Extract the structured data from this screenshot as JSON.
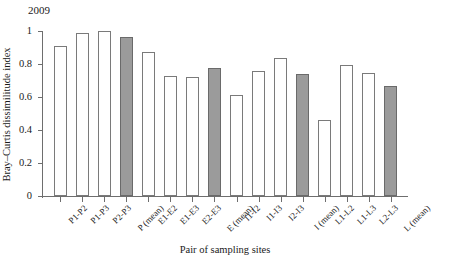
{
  "chart_data": {
    "type": "bar",
    "title": "2009",
    "xlabel": "Pair of sampling sites",
    "ylabel": "Bray–Curtis dissimilitude index",
    "ylim": [
      0,
      1
    ],
    "yticks": [
      "0",
      "0.2",
      "0.4",
      "0.6",
      "0.8",
      "1"
    ],
    "ytick_values": [
      0,
      0.2,
      0.4,
      0.6,
      0.8,
      1
    ],
    "grid": false,
    "legend": "none",
    "categories": [
      "P1-P2",
      "P1-P3",
      "P2-P3",
      "P (mean)",
      "E1-E2",
      "E1-E3",
      "E2-E3",
      "E (mean)",
      "I1-I2",
      "I1-I3",
      "I2-I3",
      "I (mean)",
      "L1-L2",
      "L1-L3",
      "L2-L3",
      "L (mean)"
    ],
    "values": [
      0.91,
      0.99,
      1.0,
      0.965,
      0.87,
      0.725,
      0.72,
      0.775,
      0.615,
      0.76,
      0.835,
      0.74,
      0.46,
      0.795,
      0.745,
      0.665
    ],
    "bar_styles": [
      "open",
      "open",
      "open",
      "shaded",
      "open",
      "open",
      "open",
      "shaded",
      "open",
      "open",
      "open",
      "shaded",
      "open",
      "open",
      "open",
      "shaded"
    ],
    "colors": {
      "open_fill": "#ffffff",
      "open_border": "#7a7a7a",
      "shaded_fill": "#9b9b9b",
      "shaded_border": "#6a6a6a",
      "axis": "#6e6e6e",
      "text": "#1a1a1a"
    }
  }
}
